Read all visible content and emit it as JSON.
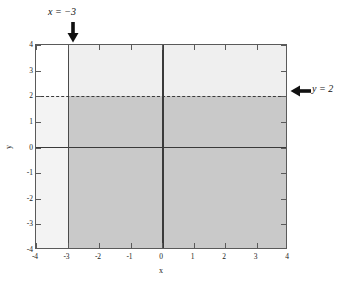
{
  "figure": {
    "title": "",
    "xlabel": "x",
    "ylabel": "y"
  },
  "annotations": {
    "x_boundary": {
      "label": "x = −3",
      "arrow_icon": "arrow-down-icon"
    },
    "y_boundary": {
      "label": "y = 2",
      "arrow_icon": "arrow-left-icon"
    }
  },
  "axis": {
    "x_ticks": [
      "-4",
      "-3",
      "-2",
      "-1",
      "0",
      "1",
      "2",
      "3",
      "4"
    ],
    "y_ticks": [
      "4",
      "3",
      "2",
      "1",
      "0",
      "-1",
      "-2",
      "-3",
      "-4"
    ]
  },
  "colors": {
    "solution_fill": "#c9c9c9",
    "upper_fill": "#efefef",
    "left_lower_fill": "#f3f3f3",
    "left_upper_fill": "#ffffff",
    "boundary_solid": "#4a4a4a",
    "boundary_dashed": "#3a3a3a",
    "axis_line": "#3a3a3a",
    "frame": "#5a5a5a"
  },
  "chart_data": {
    "type": "area",
    "title": "",
    "xlabel": "x",
    "ylabel": "y",
    "xlim": [
      -4,
      4
    ],
    "ylim": [
      -4,
      4
    ],
    "xticks": [
      -4,
      -3,
      -2,
      -1,
      0,
      1,
      2,
      3,
      4
    ],
    "yticks": [
      -4,
      -3,
      -2,
      -1,
      0,
      1,
      2,
      3,
      4
    ],
    "grid": false,
    "legend": null,
    "boundaries": [
      {
        "name": "x = -3",
        "orientation": "vertical",
        "value": -3,
        "style": "solid",
        "inequality": "x >= -3",
        "label": "x = −3"
      },
      {
        "name": "y = 2",
        "orientation": "horizontal",
        "value": 2,
        "style": "dashed",
        "inequality": "y < 2",
        "label": "y = 2"
      }
    ],
    "regions": [
      {
        "name": "intersection",
        "description": "x >= -3 and y <= 2",
        "x_range": [
          -3,
          4
        ],
        "y_range": [
          -4,
          2
        ],
        "shade": "#c9c9c9"
      },
      {
        "name": "x-halfplane-only",
        "description": "x >= -3 and y > 2",
        "x_range": [
          -3,
          4
        ],
        "y_range": [
          2,
          4
        ],
        "shade": "#efefef"
      },
      {
        "name": "y-halfplane-only",
        "description": "x < -3 and y <= 2",
        "x_range": [
          -4,
          -3
        ],
        "y_range": [
          -4,
          2
        ],
        "shade": "#f3f3f3"
      },
      {
        "name": "unshaded",
        "description": "x < -3 and y > 2",
        "x_range": [
          -4,
          -3
        ],
        "y_range": [
          2,
          4
        ],
        "shade": "#ffffff"
      }
    ]
  }
}
